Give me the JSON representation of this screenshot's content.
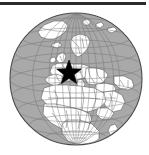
{
  "figure": {
    "name": "orthographic-globe-locator-map",
    "background_color": "#ffffff",
    "width": 149,
    "height": 155
  },
  "top_rule": {
    "name": "horizontal-rule",
    "color": "#2b2b2b",
    "x": 0,
    "y": 2,
    "width": 146,
    "height": 3
  },
  "globe": {
    "projection": "orthographic",
    "center_x": 76,
    "center_y": 79,
    "radius": 66,
    "ocean_color": "#a9a9a9",
    "land_color": "#ffffff",
    "border_color": "#555555",
    "outline_color": "#4a4a4a",
    "graticule_color": "#6e6e6e",
    "graticule_spacing_degrees": 15,
    "view_center_lon": 10,
    "view_center_lat": 25,
    "visible_regions": [
      "Europe",
      "Africa",
      "Middle East",
      "Greenland",
      "Arctic",
      "Western Asia",
      "North Atlantic Ocean"
    ]
  },
  "marker": {
    "name": "location-star-marker",
    "shape": "star",
    "points": 5,
    "color": "#000000",
    "x": 69,
    "y": 73,
    "outer_radius": 13,
    "inner_radius": 5.4,
    "label": "",
    "region": "Central Europe"
  },
  "chart_data": {
    "type": "scatter",
    "title": "",
    "xlabel": "",
    "ylabel": "",
    "projection": "orthographic globe",
    "series": [
      {
        "name": "location-marker",
        "marker": "star",
        "color": "#000000",
        "points": [
          {
            "x": 69,
            "y": 73,
            "label": "Central Europe"
          }
        ]
      }
    ],
    "legend": "none",
    "grid": true
  }
}
